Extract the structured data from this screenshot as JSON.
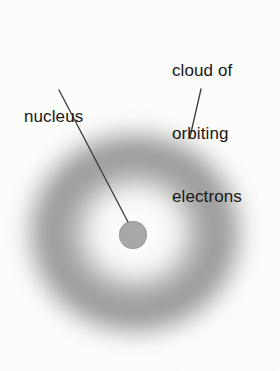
{
  "figure": {
    "background_color": "#fdfdfc",
    "width": 280,
    "height": 371
  },
  "labels": {
    "nucleus": {
      "text": "nucleus",
      "color": "#171717",
      "x": 24,
      "y": 64
    },
    "cloud": {
      "lines": [
        "cloud of",
        "orbiting",
        "electrons"
      ],
      "color": "#171717",
      "x": 172,
      "y": 18
    }
  },
  "leader_lines": [
    {
      "name": "nucleus-leader",
      "from": [
        59,
        90
      ],
      "to": [
        128,
        222
      ],
      "color": "#3a3a3a",
      "width": 1.3
    },
    {
      "name": "cloud-leader",
      "from": [
        201,
        89
      ],
      "to": [
        190,
        137
      ],
      "color": "#3a3a3a",
      "width": 1.3
    }
  ],
  "shapes": {
    "nucleus": {
      "name": "nucleus-circle",
      "center": [
        133,
        235
      ],
      "radius": 14,
      "color": "#a9a9a9"
    },
    "electron_cloud": {
      "name": "electron-cloud-annulus",
      "center": [
        135,
        233
      ],
      "outer_radius": 131,
      "ring_peak_radius": 88,
      "inner_light_radius": 40,
      "peak_color": "#9a9a9a",
      "edge_color": "#fdfdfc"
    }
  }
}
